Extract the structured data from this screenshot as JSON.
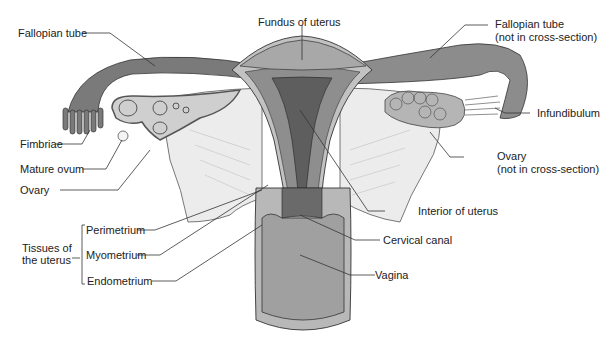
{
  "diagram": {
    "labels": {
      "fallopian_tube_left": "Fallopian tube",
      "fundus": "Fundus of uterus",
      "fallopian_tube_right_1": "Fallopian tube",
      "fallopian_tube_right_2": "(not in cross-section)",
      "fimbriae": "Fimbriae",
      "mature_ovum": "Mature ovum",
      "ovary_left": "Ovary",
      "infundibulum": "Infundibulum",
      "ovary_right_1": "Ovary",
      "ovary_right_2": "(not in cross-section)",
      "interior_uterus": "Interior of uterus",
      "tissues_1": "Tissues of",
      "tissues_2": "the uterus",
      "perimetrium": "Perimetrium",
      "myometrium": "Myometrium",
      "endometrium": "Endometrium",
      "cervical_canal": "Cervical canal",
      "vagina": "Vagina"
    },
    "colors": {
      "outer": "#8a8a8a",
      "muscle": "#a9a9a9",
      "light": "#d4d4d4",
      "dark": "#5e5e5e",
      "ligament": "#ececec",
      "line": "#333333"
    }
  }
}
